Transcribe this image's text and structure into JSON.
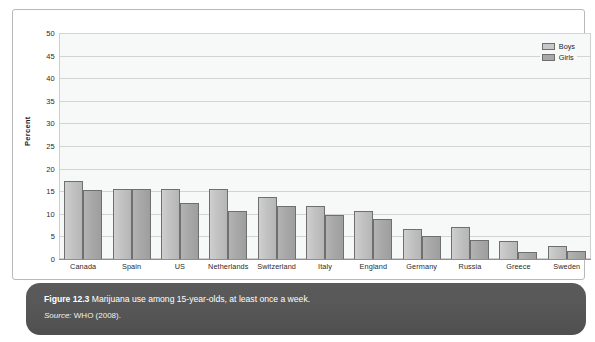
{
  "figure": {
    "caption_number": "Figure 12.3",
    "caption_text": "Marijuana use among 15-year-olds, at least once a week.",
    "source_label": "Source:",
    "source_text": "WHO (2008)."
  },
  "legend": {
    "position": "top-right",
    "entries": [
      {
        "label": "Boys",
        "color": "#c8c8c8"
      },
      {
        "label": "Girls",
        "color": "#a8a8a8"
      }
    ]
  },
  "colors": {
    "boys_bar": "#c2c2c2",
    "girls_bar": "#a8a8a8",
    "bar_outline": "#6f6f6f",
    "plot_background": "#f7f8f8",
    "gridline": "#d2d3d3",
    "caption_background": "#585858",
    "caption_text": "#ffffff",
    "frame_border": "#b9b9b9"
  },
  "chart_data": {
    "type": "bar",
    "title": "",
    "subtitle": "",
    "xlabel": "",
    "ylabel": "Percent",
    "ylim": [
      0,
      50
    ],
    "ytick_labels": [
      "50",
      "45",
      "40",
      "35",
      "30",
      "25",
      "20",
      "15",
      "10",
      "5",
      "0"
    ],
    "ytick_values": [
      50,
      45,
      40,
      35,
      30,
      25,
      20,
      15,
      10,
      5,
      0
    ],
    "grid": true,
    "legend_position": "top-right",
    "categories": [
      "Canada",
      "Spain",
      "US",
      "Netherlands",
      "Switzerland",
      "Italy",
      "England",
      "Germany",
      "Russia",
      "Greece",
      "Sweden"
    ],
    "series": [
      {
        "name": "Boys",
        "color": "#c2c2c2",
        "values": [
          17.2,
          15.4,
          15.5,
          15.6,
          13.8,
          11.8,
          10.7,
          6.6,
          7.1,
          4.0,
          2.8
        ]
      },
      {
        "name": "Girls",
        "color": "#a8a8a8",
        "values": [
          15.3,
          15.4,
          12.5,
          10.6,
          11.7,
          9.8,
          8.8,
          5.0,
          4.1,
          1.6,
          1.8
        ]
      }
    ]
  }
}
